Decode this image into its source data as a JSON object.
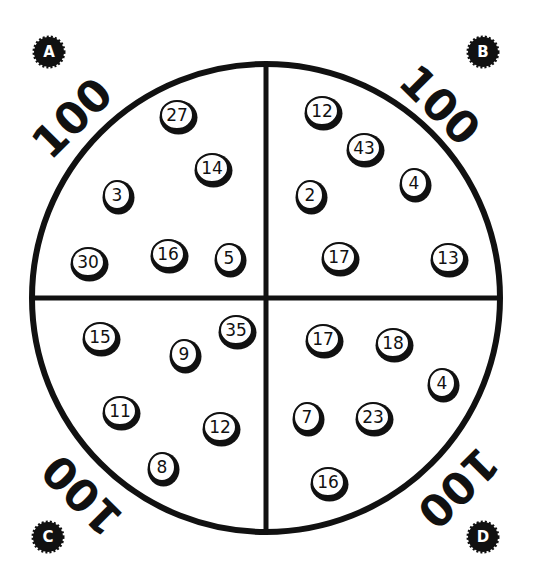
{
  "quadrants": [
    {
      "label": "A",
      "total": "100",
      "coins": [
        {
          "value": "27",
          "x": 177,
          "y": 115
        },
        {
          "value": "14",
          "x": 212,
          "y": 168
        },
        {
          "value": "3",
          "x": 117,
          "y": 195
        },
        {
          "value": "30",
          "x": 88,
          "y": 262
        },
        {
          "value": "16",
          "x": 168,
          "y": 254
        },
        {
          "value": "5",
          "x": 229,
          "y": 258
        }
      ]
    },
    {
      "label": "B",
      "total": "100",
      "coins": [
        {
          "value": "12",
          "x": 322,
          "y": 111
        },
        {
          "value": "43",
          "x": 364,
          "y": 148
        },
        {
          "value": "4",
          "x": 414,
          "y": 183
        },
        {
          "value": "2",
          "x": 310,
          "y": 195
        },
        {
          "value": "17",
          "x": 339,
          "y": 257
        },
        {
          "value": "13",
          "x": 448,
          "y": 258
        }
      ]
    },
    {
      "label": "C",
      "total": "100",
      "coins": [
        {
          "value": "15",
          "x": 100,
          "y": 337
        },
        {
          "value": "9",
          "x": 184,
          "y": 354
        },
        {
          "value": "35",
          "x": 236,
          "y": 330
        },
        {
          "value": "11",
          "x": 120,
          "y": 411
        },
        {
          "value": "12",
          "x": 220,
          "y": 427
        },
        {
          "value": "8",
          "x": 162,
          "y": 467
        }
      ]
    },
    {
      "label": "D",
      "total": "100",
      "coins": [
        {
          "value": "17",
          "x": 323,
          "y": 339
        },
        {
          "value": "18",
          "x": 393,
          "y": 343
        },
        {
          "value": "4",
          "x": 442,
          "y": 383
        },
        {
          "value": "7",
          "x": 307,
          "y": 417
        },
        {
          "value": "23",
          "x": 373,
          "y": 417
        },
        {
          "value": "16",
          "x": 328,
          "y": 482
        }
      ]
    }
  ]
}
